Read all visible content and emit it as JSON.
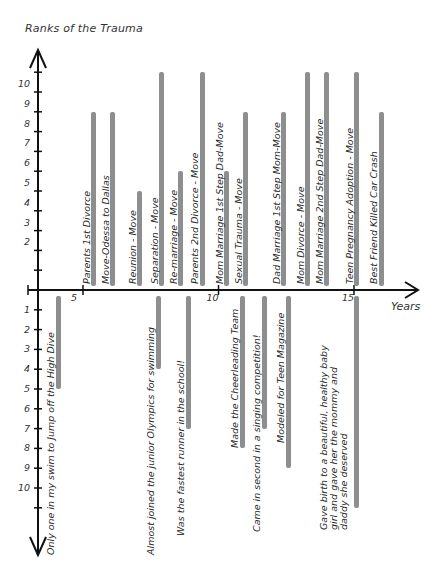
{
  "chart_data": {
    "type": "bar",
    "title": "Ranks of the Trauma",
    "xlabel": "Years",
    "ylabel": "Ranks of the Trauma",
    "x_ticks": [
      "5",
      "10",
      "15"
    ],
    "y_ticks_up": [
      "10",
      "9",
      "8",
      "7",
      "6",
      "5",
      "4",
      "3",
      "2"
    ],
    "y_ticks_down": [
      "1",
      "2",
      "3",
      "4",
      "5",
      "6",
      "7",
      "8",
      "9",
      "10"
    ],
    "xlim": [
      3.8,
      17.4
    ],
    "ylim": [
      -11,
      11
    ],
    "grid": false,
    "series": [
      {
        "name": "Trauma events (above axis)",
        "events": [
          {
            "label": "Parents 1st Divorce",
            "year": 5.4,
            "rank": 9
          },
          {
            "label": "Move-Odessa to Dallas",
            "year": 6.1,
            "rank": 9
          },
          {
            "label": "Reunion - Move",
            "year": 7.1,
            "rank": 5
          },
          {
            "label": "Separation - Move",
            "year": 7.9,
            "rank": 11
          },
          {
            "label": "Re-marriage - Move",
            "year": 8.6,
            "rank": 6
          },
          {
            "label": "Parents 2nd Divorce - Move",
            "year": 9.4,
            "rank": 11
          },
          {
            "label": "Mom Marriage 1st Step Dad-Move",
            "year": 10.3,
            "rank": 6
          },
          {
            "label": "Sexual Trauma - Move",
            "year": 11.0,
            "rank": 9
          },
          {
            "label": "Dad Marriage 1st Step Mom-Move",
            "year": 12.4,
            "rank": 9
          },
          {
            "label": "Mom Divorce - Move",
            "year": 13.3,
            "rank": 11
          },
          {
            "label": "Mom Marriage 2nd Step Dad-Move",
            "year": 14.0,
            "rank": 11
          },
          {
            "label": "Teen Pregnancy   Adoption - Move",
            "year": 15.1,
            "rank": 11
          },
          {
            "label": "Best Friend Killed Car Crash",
            "year": 16.0,
            "rank": 9
          }
        ]
      },
      {
        "name": "Positive events (below axis)",
        "events": [
          {
            "label": "Only one in my swim to Jump off  the High Dive",
            "year": 4.1,
            "rank": 5
          },
          {
            "label": "Almost joined the junior Olympics for swimming",
            "year": 7.8,
            "rank": 4
          },
          {
            "label": "Was the fastest runner in the school!",
            "year": 8.9,
            "rank": 7
          },
          {
            "label": "Made the Cheerleading Team",
            "year": 10.9,
            "rank": 8
          },
          {
            "label": "Came in second in a singing competition!",
            "year": 11.7,
            "rank": 7
          },
          {
            "label": "Modeled for Teen Magazine",
            "year": 12.6,
            "rank": 9
          },
          {
            "label": "Gave birth to a beautiful, healthy baby girl and gave her the mommy and daddy she deserved",
            "year": 15.1,
            "rank": 11
          }
        ]
      }
    ]
  },
  "colors": {
    "bar": "#8e8e8e",
    "axis": "#111111",
    "text": "#2a2a2a"
  }
}
